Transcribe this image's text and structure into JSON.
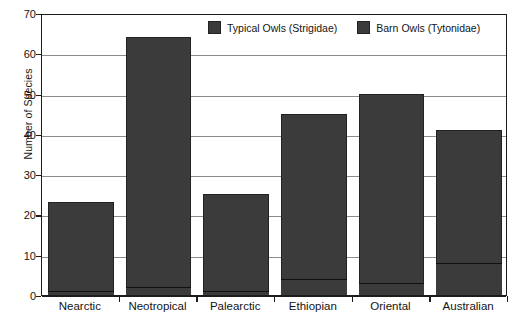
{
  "chart_data": {
    "type": "bar",
    "title": "",
    "subtitle": "",
    "xlabel": "",
    "ylabel": "Number of Species",
    "ylim": [
      0,
      70
    ],
    "yticks": [
      0,
      10,
      20,
      30,
      40,
      50,
      60,
      70
    ],
    "ytick_labels": [
      "0",
      "10",
      "20",
      "30",
      "40",
      "50",
      "60",
      "70"
    ],
    "grid": true,
    "legend_position": "top-center",
    "stacked_note": "Each bar shows the total number of owl species; the thin dark segment at the base marks the Barn Owl (Tytonidae) portion of that total.",
    "categories": [
      "Nearctic",
      "Neotropical",
      "Palearctic",
      "Ethiopian",
      "Oriental",
      "Australian"
    ],
    "series": [
      {
        "name": "Typical Owls (Strigidae)",
        "color": "#3b3b3b",
        "values": [
          23,
          64,
          25,
          45,
          50,
          41
        ]
      },
      {
        "name": "Barn Owls (Tytonidae)",
        "color": "#3b3b3b",
        "values": [
          1,
          2,
          1,
          4,
          3,
          8
        ]
      }
    ]
  },
  "legend": {
    "items": [
      {
        "label": "Typical Owls (Strigidae)",
        "color": "#3b3b3b"
      },
      {
        "label": "Barn Owls (Tytonidae)",
        "color": "#3b3b3b"
      }
    ]
  },
  "colors": {
    "bar_fill": "#3b3b3b",
    "bar_edge": "#222222",
    "grid": "#8c8c8c",
    "axis": "#1c1c1c",
    "background": "#ffffff",
    "text": "#141414"
  }
}
